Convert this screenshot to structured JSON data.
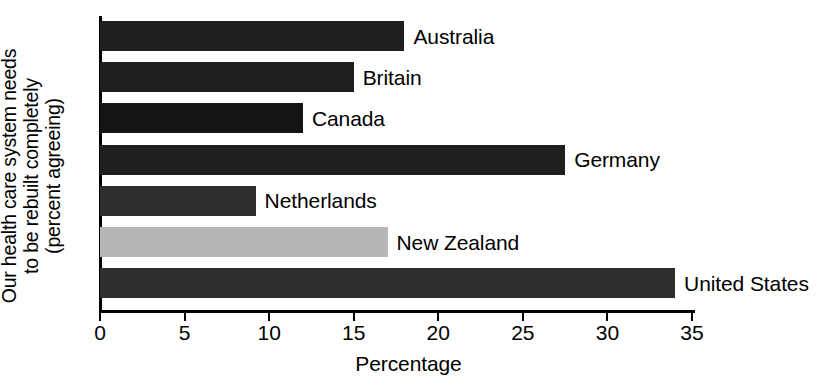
{
  "chart_data": {
    "type": "bar",
    "orientation": "horizontal",
    "title": "",
    "xlabel": "Percentage",
    "ylabel": "Our health care system needs to be rebuilt completely (percent agreeing)",
    "ylabel_lines": [
      "Our health care system needs",
      "to be rebuilt completely",
      "(percent agreeing)"
    ],
    "categories": [
      "Australia",
      "Britain",
      "Canada",
      "Germany",
      "Netherlands",
      "New Zealand",
      "United States"
    ],
    "values": [
      18,
      15,
      12,
      27.5,
      9.2,
      17,
      34
    ],
    "bar_colors": [
      "#1f1f1f",
      "#1f1f1f",
      "#141414",
      "#1f1f1f",
      "#2e2e2e",
      "#b6b6b6",
      "#2e2e2e"
    ],
    "xlim": [
      0,
      35
    ],
    "xticks": [
      0,
      5,
      10,
      15,
      20,
      25,
      30,
      35
    ],
    "xtick_labels": [
      "0",
      "5",
      "10",
      "15",
      "20",
      "25",
      "30",
      "35"
    ],
    "grid": false,
    "legend": false
  },
  "colors": {
    "background": "#ffffff",
    "axis": "#000000",
    "bar_dark": "#1f1f1f",
    "bar_light": "#b6b6b6",
    "text": "#000000"
  }
}
